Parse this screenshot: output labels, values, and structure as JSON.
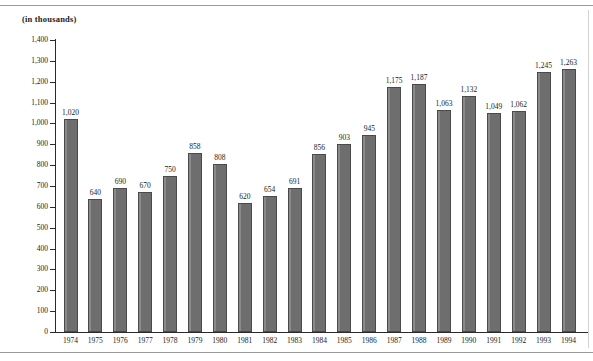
{
  "page": {
    "units_caption": "(in thousands)"
  },
  "chart_data": {
    "type": "bar",
    "title": "",
    "subtitle": "",
    "units_label": "(in thousands)",
    "xlabel": "",
    "ylabel": "",
    "ylim": [
      0,
      1400
    ],
    "ytick_step": 100,
    "grid": false,
    "legend": "none",
    "orientation": "vertical",
    "bar_color": "#6e6e6e",
    "categories": [
      "1974",
      "1975",
      "1976",
      "1977",
      "1978",
      "1979",
      "1980",
      "1981",
      "1982",
      "1983",
      "1984",
      "1985",
      "1986",
      "1987",
      "1988",
      "1989",
      "1990",
      "1991",
      "1992",
      "1993",
      "1994"
    ],
    "values": [
      1020,
      640,
      690,
      670,
      750,
      858,
      808,
      620,
      654,
      691,
      856,
      903,
      945,
      1175,
      1187,
      1063,
      1132,
      1049,
      1062,
      1245,
      1263
    ],
    "value_labels": [
      "1,020",
      "640",
      "690",
      "670",
      "750",
      "858",
      "808",
      "620",
      "654",
      "691",
      "856",
      "903",
      "945",
      "1,175",
      "1,187",
      "1,063",
      "1,132",
      "1,049",
      "1,062",
      "1,245",
      "1,263"
    ],
    "ytick_labels": [
      "1,400",
      "1,300",
      "1,200",
      "1,100",
      "1,000",
      "900",
      "800",
      "700",
      "600",
      "500",
      "400",
      "300",
      "200",
      "100",
      "0"
    ],
    "ytick_values": [
      1400,
      1300,
      1200,
      1100,
      1000,
      900,
      800,
      700,
      600,
      500,
      400,
      300,
      200,
      100,
      0
    ]
  }
}
